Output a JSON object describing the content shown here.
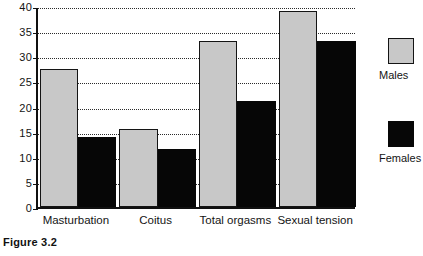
{
  "caption": "Figure 3.2",
  "chart_data": {
    "type": "bar",
    "title": "",
    "xlabel": "",
    "ylabel": "",
    "ylim": [
      0,
      40
    ],
    "yticks": [
      0,
      5,
      10,
      15,
      20,
      25,
      30,
      35,
      40
    ],
    "grid": true,
    "legend_position": "right",
    "categories": [
      "Masturbation",
      "Coitus",
      "Total orgasms",
      "Sexual tension"
    ],
    "series": [
      {
        "name": "Males",
        "color": "#c8c8c8",
        "values": [
          27.5,
          15.5,
          33,
          39
        ]
      },
      {
        "name": "Females",
        "color": "#070707",
        "values": [
          14,
          11.5,
          21,
          33
        ]
      }
    ]
  }
}
